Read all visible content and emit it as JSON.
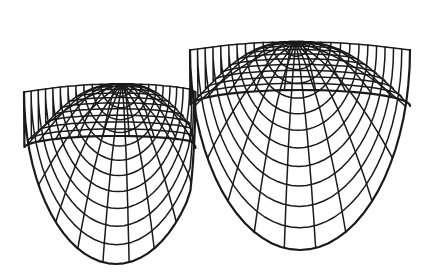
{
  "figure": {
    "type": "wireframe-surface",
    "stroke_color": "#1a1a1a",
    "background": "#ffffff",
    "peaks": [
      {
        "name": "left-peak",
        "apex": [
          122,
          84
        ],
        "rings": 12,
        "spokes": 22,
        "rx": 92,
        "ry_top": 12,
        "ry_bottom": 172,
        "skew": -6
      },
      {
        "name": "right-peak",
        "apex": [
          296,
          42
        ],
        "rings": 12,
        "spokes": 22,
        "rx": 110,
        "ry_top": 16,
        "ry_bottom": 200,
        "skew": 4
      }
    ],
    "saddle": [
      190,
      112
    ]
  }
}
